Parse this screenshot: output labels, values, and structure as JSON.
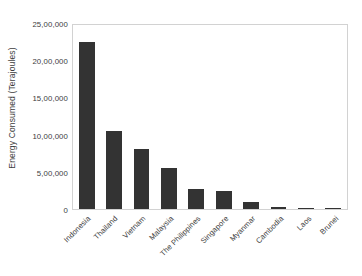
{
  "chart_data": {
    "type": "bar",
    "title": "",
    "xlabel": "",
    "ylabel": "Energy Consumed (Terajoules)",
    "categories": [
      "Indonesia",
      "Thailand",
      "Vietnam",
      "Malaysia",
      "The Philippines",
      "Singapore",
      "Myanmar",
      "Cambodia",
      "Laos",
      "Brunei"
    ],
    "values": [
      2250000,
      1050000,
      800000,
      550000,
      270000,
      240000,
      90000,
      25000,
      12000,
      8000
    ],
    "ylim": [
      0,
      2500000
    ],
    "ytick_values": [
      0,
      500000,
      1000000,
      1500000,
      2000000,
      2500000
    ],
    "ytick_labels": [
      "0",
      "5,00,000",
      "10,00,000",
      "15,00,000",
      "20,00,000",
      "25,00,000"
    ],
    "grid": false,
    "legend": null,
    "bar_color": "#333333",
    "frame_color": "#d2d2d2",
    "background_color": "#ffffff"
  }
}
